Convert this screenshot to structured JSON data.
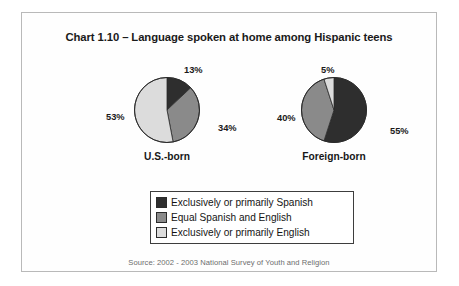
{
  "figure": {
    "title": "Chart 1.10 – Language spoken at home among Hispanic teens",
    "source": "Source: 2002 - 2003 National Survey of Youth and Religion"
  },
  "legend": {
    "items": [
      {
        "label": "Exclusively or primarily Spanish",
        "color": "#2e2e2e"
      },
      {
        "label": "Equal Spanish and English",
        "color": "#8a8a8a"
      },
      {
        "label": "Exclusively or primarily English",
        "color": "#dcdcdc"
      }
    ]
  },
  "chart_data": {
    "type": "pie",
    "title": "Chart 1.10 – Language spoken at home among Hispanic teens",
    "xlabel": "",
    "ylabel": "",
    "legend_position": "bottom-center",
    "grid": false,
    "categories": [
      "Exclusively or primarily Spanish",
      "Equal Spanish and English",
      "Exclusively or primarily English"
    ],
    "colors": [
      "#2e2e2e",
      "#8a8a8a",
      "#dcdcdc"
    ],
    "charts": [
      {
        "name": "U.S.-born",
        "caption": "U.S.-born",
        "values": [
          13,
          34,
          53
        ],
        "labels": [
          "13%",
          "34%",
          "53%"
        ]
      },
      {
        "name": "Foreign-born",
        "caption": "Foreign-born",
        "values": [
          55,
          40,
          5
        ],
        "labels": [
          "55%",
          "40%",
          "5%"
        ]
      }
    ],
    "annotations": [
      "Source: 2002 - 2003 National Survey of Youth and Religion"
    ]
  }
}
